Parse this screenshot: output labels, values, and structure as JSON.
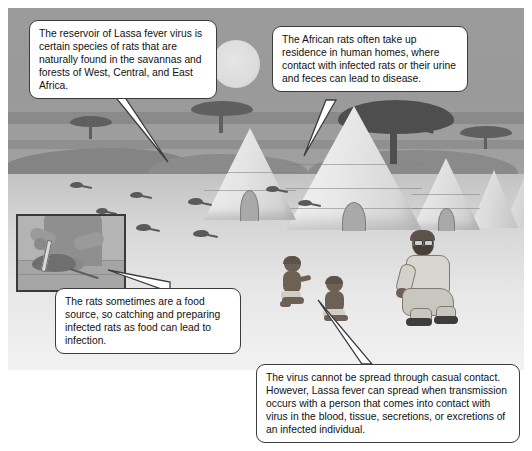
{
  "figure": {
    "scene_name": "african-savanna-village-scene"
  },
  "callouts": [
    {
      "id": "reservoir",
      "name": "callout-reservoir",
      "text": "The reservoir of Lassa fever virus is certain species of rats that are naturally found in the savannas and forests of West, Central, and East Africa."
    },
    {
      "id": "rats-in-homes",
      "name": "callout-rats-in-homes",
      "text": "The African rats often take up residence in human homes, where contact with infected rats or their urine and feces can lead to disease."
    },
    {
      "id": "rats-as-food",
      "name": "callout-rats-as-food",
      "text": "The rats sometimes are a food source, so catching and preparing infected rats as food can lead to infection."
    },
    {
      "id": "person-to-person",
      "name": "callout-person-to-person",
      "text": "The virus cannot be spread through casual contact. However, Lassa fever can spread when transmission occurs with a person that comes into contact with virus in the blood, tissue, secretions, or excretions of an infected individual."
    }
  ],
  "scene": {
    "sun": "sun",
    "sky": "savanna-sky",
    "ground": "savanna-ground",
    "huts": [
      "thatched-hut-1",
      "thatched-hut-2",
      "thatched-hut-3",
      "thatched-hut-4",
      "thatched-hut-5"
    ],
    "trees": [
      "acacia-tree-left",
      "acacia-tree-middle",
      "acacia-tree-large",
      "acacia-tree-right"
    ],
    "rats_count": 8,
    "people": [
      "crouching-child-left",
      "sitting-child-middle",
      "crouching-adult-man"
    ],
    "inset": {
      "name": "inset-rat-preparation",
      "elements": [
        "hands",
        "knife",
        "rat-carcass",
        "table"
      ]
    }
  },
  "colors": {
    "sky": "#9a9a9a",
    "ground": "#d9d9d9",
    "hut": "#e4e4e4",
    "tree": "#4e4e4e",
    "callout_border": "#3c3c3c",
    "callout_fill": "#ffffff",
    "text": "#111111",
    "rat": "#5a5a5a",
    "skin": "#6d6156"
  }
}
